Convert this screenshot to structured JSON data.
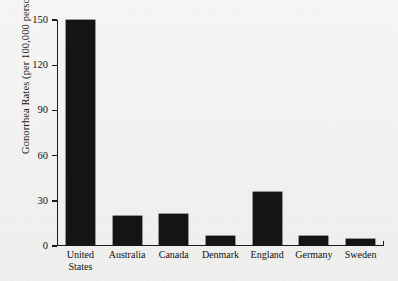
{
  "chart_data": {
    "type": "bar",
    "title": "",
    "xlabel": "",
    "ylabel": "Gonorrhea Rates (per 100,000 persons)",
    "categories": [
      "United\nStates",
      "Australia",
      "Canada",
      "Denmark",
      "England",
      "Germany",
      "Sweden"
    ],
    "values": [
      149,
      19,
      20,
      6,
      35,
      6,
      4
    ],
    "ylim": [
      0,
      150
    ],
    "yticks": [
      0,
      30,
      60,
      90,
      120,
      150
    ],
    "ytick_labels": [
      "0",
      "30",
      "60",
      "90",
      "120",
      "150"
    ],
    "grid": false,
    "legend": null,
    "bar_color": "#141414",
    "axis_color": "#1b1b1b",
    "background_color": "#f2f2f0"
  },
  "axis": {
    "y_title": "Gonorrhea Rates (per 100,000 persons)"
  }
}
